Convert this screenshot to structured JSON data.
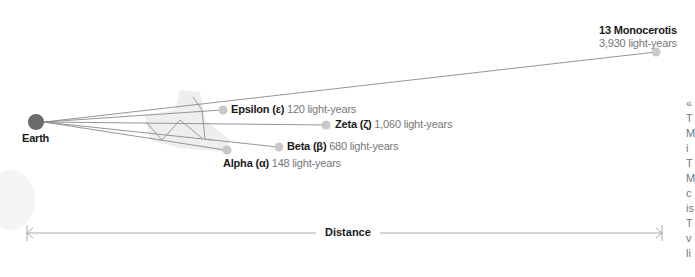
{
  "diagram": {
    "origin": {
      "label": "Earth",
      "color": "#6b6b6b"
    },
    "stars": [
      {
        "id": "13-monocerotis",
        "name": "13 Monocerotis",
        "greek": "",
        "distance": "3,930 light-years"
      },
      {
        "id": "epsilon",
        "name": "Epsilon (ε)",
        "greek": "ε",
        "distance": "120 light-years"
      },
      {
        "id": "zeta",
        "name": "Zeta (ζ)",
        "greek": "ζ",
        "distance": "1,060 light-years"
      },
      {
        "id": "beta",
        "name": "Beta (β)",
        "greek": "β",
        "distance": "680 light-years"
      },
      {
        "id": "alpha",
        "name": "Alpha (α)",
        "greek": "α",
        "distance": "148 light-years"
      }
    ],
    "axis": {
      "label": "Distance"
    },
    "colors": {
      "star": "#c8c8c8",
      "line": "#8a8a8a",
      "constellation_bg": "#eeeeee",
      "earth": "#6b6b6b"
    },
    "side_text_fragments": [
      "«",
      "T",
      "M",
      "i",
      "T",
      "M",
      "c",
      "is",
      "T",
      "v",
      "li"
    ]
  }
}
